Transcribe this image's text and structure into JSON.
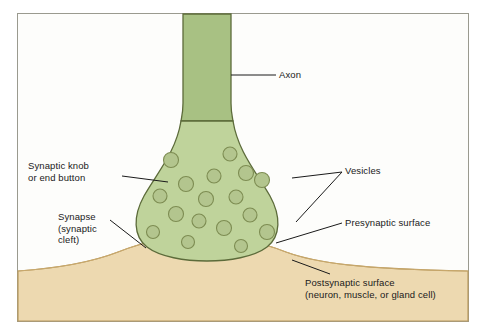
{
  "figure": {
    "title": "",
    "type": "biological-diagram"
  },
  "colors": {
    "axon_fill": "#a8c183",
    "knob_fill": "#bfd39b",
    "outline": "#5c6b3a",
    "vesicle_fill": "#b3c58e",
    "vesicle_outline": "#7d8c52",
    "postsynaptic_fill": "#edd9b0",
    "postsynaptic_outline": "#b99a5e",
    "border": "#9a9a8f",
    "leader": "#1a1a1a",
    "text": "#1a1a1a"
  },
  "labels": {
    "axon": "Axon",
    "synaptic_knob": "Synaptic knob\nor end button",
    "vesicles": "Vesicles",
    "synapse": "Synapse\n(synaptic\ncleft)",
    "presynaptic": "Presynaptic surface",
    "postsynaptic": "Postsynaptic surface\n(neuron, muscle, or gland cell)"
  }
}
